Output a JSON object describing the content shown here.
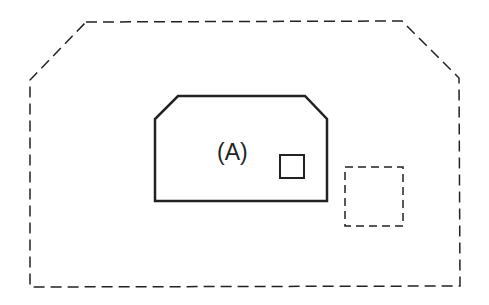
{
  "diagram": {
    "outer_region": {
      "style": "dashed",
      "shape": "octagonal-top"
    },
    "inner_region": {
      "style": "solid",
      "label": "(A)"
    },
    "small_square": {
      "style": "solid"
    },
    "dashed_square": {
      "style": "dashed"
    },
    "colors": {
      "stroke": "#222222",
      "background": "#ffffff"
    }
  }
}
